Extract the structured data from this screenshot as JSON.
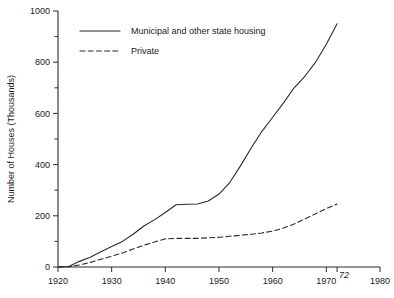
{
  "chart_data": {
    "type": "line",
    "title": "",
    "xlabel": "",
    "ylabel": "Number of Houses (Thousands)",
    "xlim": [
      1920,
      1980
    ],
    "ylim": [
      0,
      1000
    ],
    "grid": false,
    "legend_position": "upper-left inside plot",
    "x_ticks": [
      1920,
      1930,
      1940,
      1950,
      1960,
      1970,
      1980
    ],
    "x_tick_labels": [
      "1920",
      "1930",
      "1940",
      "1950",
      "1960",
      "1970",
      "1980"
    ],
    "x_extra_tick": 1972,
    "x_extra_tick_label": "72",
    "y_ticks": [
      0,
      200,
      400,
      600,
      800,
      1000
    ],
    "y_tick_labels": [
      "0",
      "200",
      "400",
      "600",
      "800",
      "1000"
    ],
    "y_minor_ticks": [
      100,
      300,
      500,
      700,
      900
    ],
    "series": [
      {
        "name": "Municipal and other state housing",
        "style": "solid",
        "color": "#2b2b2b",
        "x": [
          1920,
          1922,
          1924,
          1926,
          1928,
          1930,
          1932,
          1934,
          1936,
          1938,
          1940,
          1942,
          1944,
          1946,
          1948,
          1950,
          1952,
          1954,
          1956,
          1958,
          1960,
          1962,
          1964,
          1966,
          1968,
          1970,
          1972
        ],
        "values": [
          0,
          2,
          22,
          38,
          60,
          80,
          100,
          128,
          160,
          185,
          213,
          243,
          245,
          246,
          258,
          285,
          330,
          395,
          465,
          530,
          585,
          640,
          700,
          745,
          800,
          870,
          950
        ]
      },
      {
        "name": "Private",
        "style": "dashed",
        "color": "#2b2b2b",
        "x": [
          1920,
          1922,
          1924,
          1926,
          1928,
          1930,
          1932,
          1934,
          1936,
          1938,
          1940,
          1942,
          1944,
          1946,
          1948,
          1950,
          1952,
          1954,
          1956,
          1958,
          1960,
          1962,
          1964,
          1966,
          1968,
          1970,
          1972
        ],
        "values": [
          0,
          1,
          8,
          18,
          30,
          42,
          55,
          70,
          85,
          98,
          110,
          112,
          112,
          112,
          114,
          116,
          120,
          124,
          128,
          133,
          140,
          152,
          168,
          188,
          208,
          228,
          246
        ]
      }
    ]
  },
  "legend": {
    "items": [
      {
        "label": "Municipal and other state housing",
        "style": "solid"
      },
      {
        "label": "Private",
        "style": "dashed"
      }
    ]
  }
}
